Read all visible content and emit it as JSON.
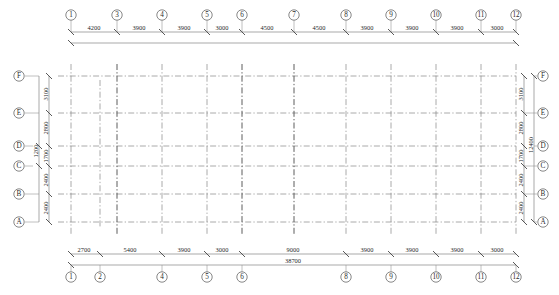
{
  "drawing": {
    "title": "Structural Column Grid Plan",
    "units": "mm",
    "overall_width": "38700",
    "overall_height": "12400"
  },
  "grid": {
    "top_bubbles": [
      "1",
      "3",
      "4",
      "5",
      "6",
      "7",
      "8",
      "9",
      "10",
      "11",
      "12"
    ],
    "bottom_bubbles": [
      "1",
      "2",
      "4",
      "5",
      "6",
      "8",
      "9",
      "10",
      "11",
      "12"
    ],
    "left_bubbles": [
      "F",
      "E",
      "D",
      "C",
      "B",
      "A"
    ],
    "right_bubbles": [
      "F",
      "E",
      "D",
      "C",
      "B",
      "A"
    ]
  },
  "dimensions": {
    "top": [
      "4200",
      "3900",
      "3900",
      "3000",
      "4500",
      "4500",
      "3900",
      "3900",
      "3900",
      "3000"
    ],
    "bottom": [
      "2700",
      "5400",
      "3900",
      "3000",
      "9000",
      "3900",
      "3900",
      "3900",
      "3000"
    ],
    "bottom_total": "38700",
    "left": [
      "3100",
      "2800",
      "1700",
      "2400",
      "2400"
    ],
    "left_extra": "1200",
    "right": [
      "3100",
      "2800",
      "1700",
      "2400",
      "2400"
    ],
    "right_total": "12400"
  },
  "colors": {
    "line": "#8d8d8d",
    "line_dark": "#4a4a4a",
    "text": "#1f1f1f",
    "bubble_stroke": "#555555",
    "background": "#ffffff"
  }
}
